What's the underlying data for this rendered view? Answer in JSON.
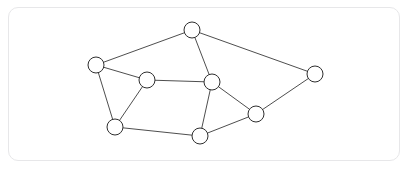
{
  "figure": {
    "card": {
      "x": 8,
      "y": 7,
      "width": 392,
      "height": 154,
      "corner_radius": 10,
      "background_color": "#ffffff",
      "border_color": "#e7e7e9"
    },
    "page_background_color": "#ffffff"
  },
  "chart_data": {
    "type": "diagram",
    "subtype": "node-link-graph",
    "title": "",
    "directed": false,
    "weighted": false,
    "labels_shown": false,
    "node_count": 8,
    "edge_count": 12,
    "node_radius": 8,
    "node_fill_color": "#ffffff",
    "node_stroke_color": "#2e2e2e",
    "edge_stroke_color": "#3a3a3a",
    "nodes": [
      {
        "id": "n1",
        "label": "",
        "x": 192,
        "y": 30,
        "r": 8,
        "degree": 3
      },
      {
        "id": "n2",
        "label": "",
        "x": 96,
        "y": 65,
        "r": 8,
        "degree": 3
      },
      {
        "id": "n3",
        "label": "",
        "x": 315,
        "y": 74,
        "r": 8,
        "degree": 2
      },
      {
        "id": "n4",
        "label": "",
        "x": 147,
        "y": 80,
        "r": 8,
        "degree": 3
      },
      {
        "id": "n5",
        "label": "",
        "x": 212,
        "y": 82,
        "r": 8,
        "degree": 4
      },
      {
        "id": "n6",
        "label": "",
        "x": 256,
        "y": 114,
        "r": 8,
        "degree": 3
      },
      {
        "id": "n7",
        "label": "",
        "x": 115,
        "y": 127,
        "r": 8,
        "degree": 3
      },
      {
        "id": "n8",
        "label": "",
        "x": 200,
        "y": 136,
        "r": 8,
        "degree": 3
      }
    ],
    "edges": [
      {
        "source": "n1",
        "target": "n2"
      },
      {
        "source": "n1",
        "target": "n5"
      },
      {
        "source": "n1",
        "target": "n3"
      },
      {
        "source": "n2",
        "target": "n4"
      },
      {
        "source": "n2",
        "target": "n7"
      },
      {
        "source": "n4",
        "target": "n5"
      },
      {
        "source": "n4",
        "target": "n7"
      },
      {
        "source": "n5",
        "target": "n6"
      },
      {
        "source": "n5",
        "target": "n8"
      },
      {
        "source": "n6",
        "target": "n3"
      },
      {
        "source": "n6",
        "target": "n8"
      },
      {
        "source": "n7",
        "target": "n8"
      }
    ]
  }
}
